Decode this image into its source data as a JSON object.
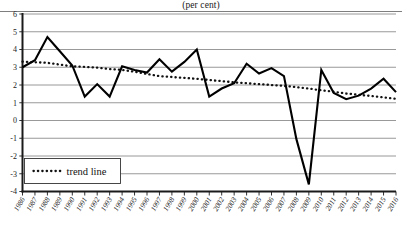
{
  "chart_data": {
    "type": "line",
    "title": "(per cent)",
    "xlabel": "",
    "ylabel": "",
    "ylim": [
      -4,
      6
    ],
    "ytick_step": 1,
    "yticks": [
      "6",
      "5",
      "4",
      "3",
      "2",
      "1",
      "0",
      "-1",
      "-2",
      "-3",
      "-4"
    ],
    "grid": true,
    "legend_position": "bottom-left",
    "categories": [
      "1986",
      "1987",
      "1988",
      "1989",
      "1990",
      "1991",
      "1992",
      "1993",
      "1994",
      "1995",
      "1996",
      "1997",
      "1998",
      "1999",
      "2000",
      "2001",
      "2002",
      "2003",
      "2004",
      "2005",
      "2006",
      "2007",
      "2008",
      "2009",
      "2010",
      "2011",
      "2012",
      "2013",
      "2014",
      "2015",
      "2016"
    ],
    "series": [
      {
        "name": "growth rate",
        "style": "solid",
        "values": [
          3.0,
          3.4,
          4.7,
          3.9,
          3.1,
          1.35,
          2.05,
          1.35,
          3.05,
          2.85,
          2.7,
          3.45,
          2.75,
          3.3,
          4.0,
          1.35,
          1.8,
          2.1,
          3.2,
          2.65,
          2.95,
          2.5,
          -1.05,
          -3.6,
          2.85,
          1.55,
          1.2,
          1.4,
          1.8,
          2.35,
          1.6
        ]
      },
      {
        "name": "trend line",
        "style": "dotted",
        "values": [
          3.32,
          3.28,
          3.25,
          3.15,
          3.05,
          3.02,
          2.98,
          2.9,
          2.85,
          2.75,
          2.62,
          2.5,
          2.45,
          2.4,
          2.35,
          2.28,
          2.22,
          2.15,
          2.1,
          2.05,
          2.0,
          1.95,
          1.88,
          1.8,
          1.7,
          1.62,
          1.52,
          1.45,
          1.38,
          1.3,
          1.22
        ]
      }
    ],
    "legend": [
      {
        "label": "trend line",
        "marker": "dotted"
      }
    ]
  }
}
